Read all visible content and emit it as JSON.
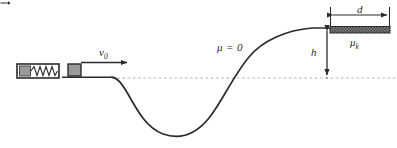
{
  "figure": {
    "width": 397,
    "height": 148,
    "background_color": "#ffffff",
    "stroke_color": "#2b2b2b",
    "block_fill_color": "#9a9a9a",
    "block_edge_color": "#2b2b2b",
    "friction_strip_color": "#4a4a4a",
    "dashed_line_color": "#b4b4b4"
  },
  "labels": {
    "initial_velocity": "v",
    "initial_velocity_subscript": "0",
    "frictionless_region": "μ = 0",
    "friction_coefficient": "μ",
    "friction_coefficient_subscript": "k",
    "height": "h",
    "distance": "d"
  },
  "elements": {
    "spring_launcher": "spring-launcher",
    "block": "block",
    "velocity_arrow": "velocity-arrow",
    "track_curve": "track-curve",
    "baseline": "dashed-baseline",
    "friction_strip": "friction-strip",
    "height_dimension": "height-dimension-arrow",
    "distance_dimension": "distance-dimension-arrow"
  },
  "geometry": {
    "baseline_y": 78,
    "plateau_y": 28,
    "height_h_px": 50,
    "distance_d_px": 60,
    "valley_bottom_y": 135,
    "launch_x": 82,
    "strip_start_x": 330,
    "strip_end_x": 390
  }
}
